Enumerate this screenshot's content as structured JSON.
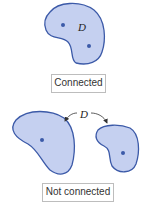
{
  "colors": {
    "fill": "#c5d0f0",
    "stroke": "#3c5aa8",
    "point": "#3c5aa8"
  },
  "top": {
    "region_label": "D",
    "caption": "Connected"
  },
  "bottom": {
    "region_label": "D",
    "caption": "Not connected"
  }
}
